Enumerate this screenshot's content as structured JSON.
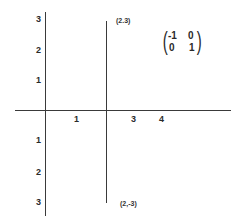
{
  "diagram": {
    "type": "coordinate-plane-reflection",
    "colors": {
      "axis": "#3a3a3a",
      "text": "#2a2a2a",
      "background": "#ffffff"
    },
    "y_axis_labels_upper": [
      "3",
      "2",
      "1"
    ],
    "y_axis_labels_lower": [
      "1",
      "2",
      "3"
    ],
    "x_axis_labels": [
      "1",
      "3",
      "4"
    ],
    "segment": {
      "x": 2,
      "top_label": "(2.3)",
      "bottom_label": "(2,-3)"
    },
    "matrix": {
      "rows": [
        [
          "-1",
          "0"
        ],
        [
          "0",
          "1"
        ]
      ]
    }
  }
}
